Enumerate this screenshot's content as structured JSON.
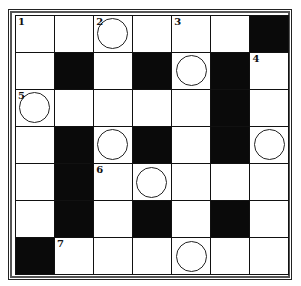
{
  "puzzle": {
    "rows": 7,
    "cols": 7,
    "grid": [
      [
        "W",
        "W",
        "W",
        "W",
        "W",
        "W",
        "B"
      ],
      [
        "W",
        "B",
        "W",
        "B",
        "W",
        "B",
        "W"
      ],
      [
        "W",
        "W",
        "W",
        "W",
        "W",
        "B",
        "W"
      ],
      [
        "W",
        "B",
        "W",
        "B",
        "W",
        "B",
        "W"
      ],
      [
        "W",
        "B",
        "W",
        "W",
        "W",
        "W",
        "W"
      ],
      [
        "W",
        "B",
        "W",
        "B",
        "W",
        "B",
        "W"
      ],
      [
        "B",
        "W",
        "W",
        "W",
        "W",
        "W",
        "W"
      ]
    ],
    "numbers": [
      {
        "row": 0,
        "col": 0,
        "n": "1"
      },
      {
        "row": 0,
        "col": 2,
        "n": "2"
      },
      {
        "row": 0,
        "col": 4,
        "n": "3"
      },
      {
        "row": 1,
        "col": 6,
        "n": "4"
      },
      {
        "row": 2,
        "col": 0,
        "n": "5"
      },
      {
        "row": 4,
        "col": 2,
        "n": "6"
      },
      {
        "row": 6,
        "col": 1,
        "n": "7"
      }
    ],
    "circles": [
      {
        "row": 0,
        "col": 2
      },
      {
        "row": 1,
        "col": 4
      },
      {
        "row": 2,
        "col": 0
      },
      {
        "row": 3,
        "col": 2
      },
      {
        "row": 3,
        "col": 6
      },
      {
        "row": 4,
        "col": 3
      },
      {
        "row": 6,
        "col": 4
      }
    ]
  }
}
